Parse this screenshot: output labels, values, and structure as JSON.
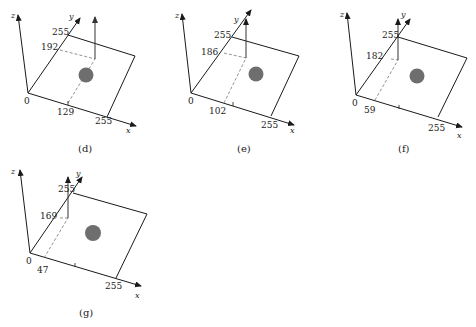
{
  "figure": {
    "colors": {
      "line": "#1a1a1a",
      "dashed": "#777777",
      "arrow": "#555555",
      "disk": "#6e6e6e"
    },
    "panels": [
      {
        "id": "d",
        "caption": "(d)",
        "axis_labels": {
          "x": "x",
          "y": "y",
          "z": "z"
        },
        "origin_label": "0",
        "x_max_label": "255",
        "y_max_label": "255",
        "x_value": "129",
        "y_value": "192"
      },
      {
        "id": "e",
        "caption": "(e)",
        "axis_labels": {
          "x": "x",
          "y": "y",
          "z": "z"
        },
        "origin_label": "0",
        "x_max_label": "255",
        "y_max_label": "255",
        "x_value": "102",
        "y_value": "186"
      },
      {
        "id": "f",
        "caption": "(f)",
        "axis_labels": {
          "x": "x",
          "y": "y",
          "z": "z"
        },
        "origin_label": "0",
        "x_max_label": "255",
        "y_max_label": "255",
        "x_value": "59",
        "y_value": "182"
      },
      {
        "id": "g",
        "caption": "(g)",
        "axis_labels": {
          "x": "x",
          "y": "y",
          "z": "z"
        },
        "origin_label": "0",
        "x_max_label": "255",
        "y_max_label": "255",
        "x_value": "47",
        "y_value": "169"
      }
    ]
  }
}
